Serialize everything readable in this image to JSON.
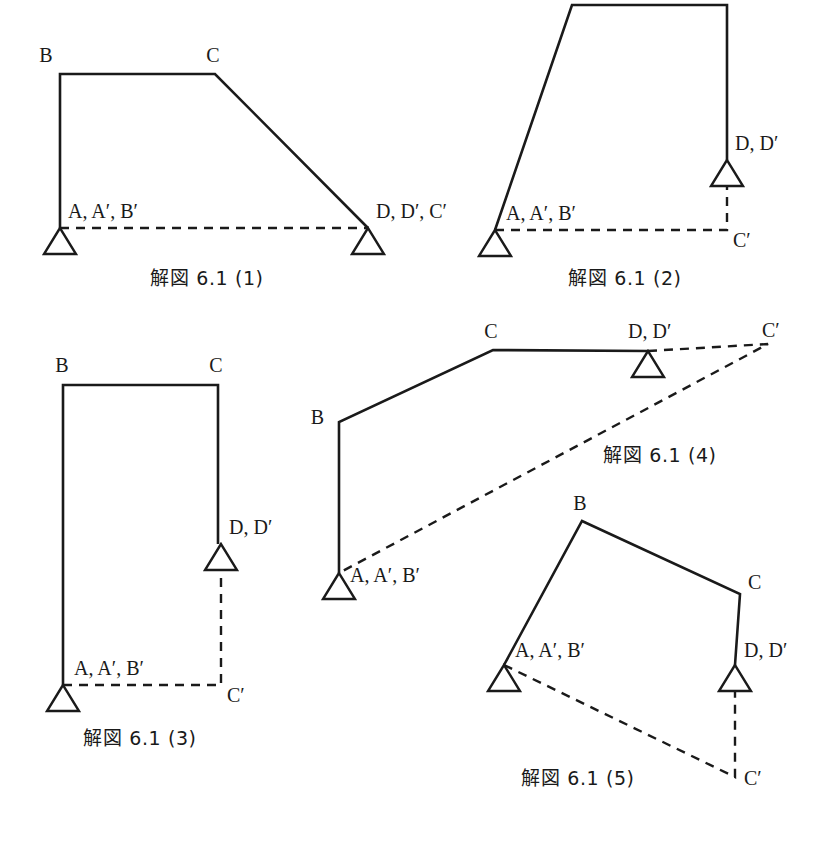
{
  "page": {
    "width": 837,
    "height": 844,
    "background": "#ffffff",
    "ink_color": "#1a1a1a"
  },
  "chart_data": {
    "type": "diagram",
    "subtype": "structural-frame-displacement",
    "title": "解図 6.1",
    "count": 5,
    "panels": [
      {
        "id": 1,
        "caption": "解図 6.1 (1)",
        "caption_pos": [
          207,
          285
        ],
        "members": [
          [
            60,
            228
          ],
          [
            60,
            74
          ],
          [
            215,
            74
          ],
          [
            368,
            228
          ]
        ],
        "displacement": [
          [
            60,
            228
          ],
          [
            368,
            228
          ]
        ],
        "supports": [
          {
            "name": "support-a",
            "apex": [
              60,
              228
            ],
            "half_width": 16,
            "height": 26
          },
          {
            "name": "support-d",
            "apex": [
              368,
              228
            ],
            "half_width": 16,
            "height": 26
          }
        ],
        "labels": [
          {
            "text": "B",
            "x": 46,
            "y": 62,
            "anchor": "middle"
          },
          {
            "text": "C",
            "x": 213,
            "y": 62,
            "anchor": "middle"
          },
          {
            "text": "A, A′, B′",
            "x": 68,
            "y": 218,
            "anchor": "start"
          },
          {
            "text": "D, D′, C′",
            "x": 376,
            "y": 218,
            "anchor": "start"
          }
        ]
      },
      {
        "id": 2,
        "caption": "解図 6.1 (2)",
        "caption_pos": [
          625,
          285
        ],
        "members": [
          [
            495,
            230
          ],
          [
            572,
            5
          ],
          [
            727,
            5
          ],
          [
            727,
            160
          ]
        ],
        "displacement": [
          [
            495,
            230
          ],
          [
            727,
            230
          ],
          [
            727,
            160
          ]
        ],
        "supports": [
          {
            "name": "support-a",
            "apex": [
              495,
              230
            ],
            "half_width": 16,
            "height": 26
          },
          {
            "name": "support-d",
            "apex": [
              727,
              160
            ],
            "half_width": 16,
            "height": 26
          }
        ],
        "labels": [
          {
            "text": "B",
            "x": 570,
            "y": 0,
            "anchor": "middle"
          },
          {
            "text": "C",
            "x": 728,
            "y": 0,
            "anchor": "middle"
          },
          {
            "text": "A, A′, B′",
            "x": 506,
            "y": 220,
            "anchor": "start"
          },
          {
            "text": "D, D′",
            "x": 735,
            "y": 150,
            "anchor": "start"
          },
          {
            "text": "C′",
            "x": 733,
            "y": 247,
            "anchor": "start"
          }
        ]
      },
      {
        "id": 3,
        "caption": "解図 6.1 (3)",
        "caption_pos": [
          140,
          745
        ],
        "members": [
          [
            63,
            685
          ],
          [
            63,
            385
          ],
          [
            218,
            385
          ],
          [
            218,
            544
          ]
        ],
        "displacement": [
          [
            63,
            685
          ],
          [
            221,
            685
          ],
          [
            221,
            544
          ]
        ],
        "supports": [
          {
            "name": "support-a",
            "apex": [
              63,
              685
            ],
            "half_width": 16,
            "height": 26
          },
          {
            "name": "support-d",
            "apex": [
              221,
              544
            ],
            "half_width": 16,
            "height": 26
          }
        ],
        "labels": [
          {
            "text": "B",
            "x": 62,
            "y": 372,
            "anchor": "middle"
          },
          {
            "text": "C",
            "x": 216,
            "y": 372,
            "anchor": "middle"
          },
          {
            "text": "A, A′, B′",
            "x": 74,
            "y": 675,
            "anchor": "start"
          },
          {
            "text": "D, D′",
            "x": 229,
            "y": 534,
            "anchor": "start"
          },
          {
            "text": "C′",
            "x": 227,
            "y": 702,
            "anchor": "start"
          }
        ]
      },
      {
        "id": 4,
        "caption": "解図 6.1 (4)",
        "caption_pos": [
          660,
          462
        ],
        "members": [
          [
            339,
            573
          ],
          [
            339,
            422
          ],
          [
            493,
            350
          ],
          [
            648,
            351
          ]
        ],
        "displacement": [
          [
            648,
            351
          ],
          [
            768,
            344
          ],
          [
            339,
            573
          ]
        ],
        "supports": [
          {
            "name": "support-a",
            "apex": [
              339,
              573
            ],
            "half_width": 16,
            "height": 26
          },
          {
            "name": "support-d",
            "apex": [
              648,
              351
            ],
            "half_width": 16,
            "height": 26
          }
        ],
        "labels": [
          {
            "text": "C",
            "x": 491,
            "y": 338,
            "anchor": "middle"
          },
          {
            "text": "B",
            "x": 324,
            "y": 424,
            "anchor": "end"
          },
          {
            "text": "D, D′",
            "x": 628,
            "y": 338,
            "anchor": "start"
          },
          {
            "text": "C′",
            "x": 762,
            "y": 337,
            "anchor": "start"
          },
          {
            "text": "A, A′, B′",
            "x": 350,
            "y": 582,
            "anchor": "start"
          }
        ]
      },
      {
        "id": 5,
        "caption": "解図 6.1 (5)",
        "caption_pos": [
          578,
          785
        ],
        "members": [
          [
            504,
            665
          ],
          [
            582,
            521
          ],
          [
            740,
            594
          ],
          [
            735,
            665
          ]
        ],
        "displacement": [
          [
            504,
            665
          ],
          [
            735,
            777
          ],
          [
            735,
            665
          ]
        ],
        "supports": [
          {
            "name": "support-a",
            "apex": [
              504,
              665
            ],
            "half_width": 16,
            "height": 26
          },
          {
            "name": "support-d",
            "apex": [
              735,
              665
            ],
            "half_width": 16,
            "height": 26
          }
        ],
        "labels": [
          {
            "text": "B",
            "x": 580,
            "y": 510,
            "anchor": "middle"
          },
          {
            "text": "C",
            "x": 748,
            "y": 589,
            "anchor": "start"
          },
          {
            "text": "A, A′, B′",
            "x": 515,
            "y": 657,
            "anchor": "start"
          },
          {
            "text": "D, D′",
            "x": 744,
            "y": 657,
            "anchor": "start"
          },
          {
            "text": "C′",
            "x": 744,
            "y": 785,
            "anchor": "start"
          }
        ]
      }
    ]
  }
}
